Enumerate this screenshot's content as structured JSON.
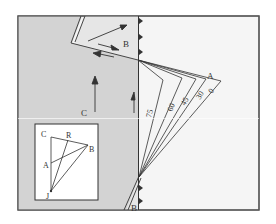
{
  "figure": {
    "type": "triple-junction-diagram",
    "colors": {
      "plate_c_fill": "#d3d3d3",
      "plate_b_fill": "#e6e6e6",
      "plate_a_fill": "#f5f5f5",
      "line": "#333333",
      "frame": "#555555"
    },
    "plate_labels": {
      "b_top": "B",
      "a": "A",
      "c": "C",
      "b_bottom": "B"
    },
    "angle_labels": [
      "75",
      "60",
      "45",
      "30",
      "0"
    ],
    "inset": {
      "labels": {
        "c": "C",
        "r": "R",
        "b": "B",
        "a": "A",
        "j": "J"
      }
    }
  }
}
